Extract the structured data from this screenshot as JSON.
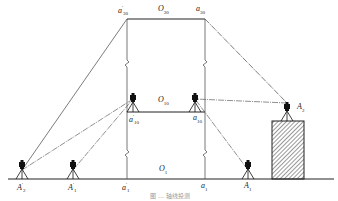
{
  "figure": {
    "caption": "图 … 轴线投测",
    "labels": {
      "top_left": {
        "base": "a",
        "prime": "′",
        "sub": "30"
      },
      "top_center": {
        "base": "O",
        "sub": "30"
      },
      "top_right": {
        "base": "a",
        "sub": "30"
      },
      "mid_center": {
        "base": "O",
        "sub": "10"
      },
      "mid_left": {
        "base": "a",
        "prime": "′",
        "sub": "10"
      },
      "mid_right": {
        "base": "a",
        "sub": "10"
      },
      "station_A2_roof": {
        "base": "A",
        "sub": "2"
      },
      "ground_O1": {
        "base": "O",
        "sub": "1"
      },
      "ground_A2p": {
        "base": "A",
        "prime": "′",
        "sub": "2"
      },
      "ground_A1p": {
        "base": "A",
        "prime": "′",
        "sub": "1"
      },
      "ground_a1p": {
        "base": "a",
        "prime": "′",
        "sub": "1"
      },
      "ground_a1": {
        "base": "a",
        "sub": "1"
      },
      "ground_A1": {
        "base": "A",
        "sub": "1"
      }
    },
    "icons": [
      "theodolite-tripod-icon",
      "building-hatched-icon"
    ]
  }
}
